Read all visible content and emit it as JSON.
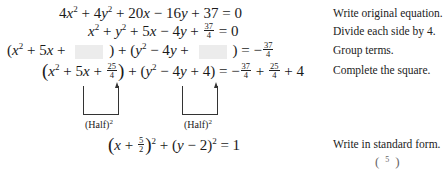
{
  "steps": [
    {
      "equation": "4x² + 4y² + 20x − 16y + 37 = 0",
      "note": "Write original equation."
    },
    {
      "equation": "x² + y² + 5x − 4y + 37/4 = 0",
      "note": "Divide each side by 4."
    },
    {
      "equation": "(x² + 5x + ▢) + (y² − 4y + ▢) = −37/4",
      "note": "Group terms."
    },
    {
      "equation": "(x² + 5x + 25/4) + (y² − 4y + 4) = −37/4 + 25/4 + 4",
      "note": "Complete the square."
    },
    {
      "equation": "(x + 5/2)² + (y − 2)² = 1",
      "note": "Write in standard form."
    }
  ],
  "annotations": {
    "half_squared_left": "(Half)",
    "half_squared_right": "(Half)",
    "exponent": "2"
  },
  "tokens": {
    "r1": {
      "a": "4",
      "x": "x",
      "b": " + 4",
      "y": "y",
      "c": " + 20",
      "d": " − 16",
      "e": " + 37 = 0"
    },
    "r2": {
      "plus1": " + ",
      "plus2": " + 5",
      "minus": " − 4",
      "plus3": " + ",
      "n": "37",
      "dn": "4",
      "eq": " = 0"
    },
    "r3": {
      "open": "(",
      "p1": " + 5",
      "p2": " + ",
      "close": ") + (",
      "m": " − 4",
      "p3": " + ",
      "close2": ") = −",
      "n": "37",
      "dn": "4"
    },
    "r4": {
      "p1": " + 5",
      "p2": " + ",
      "n1": "25",
      "d1": "4",
      "mid": ") + (",
      "m": " − 4",
      "p3": " + 4",
      "eqm": ") = −",
      "n2": "37",
      "d2": "4",
      "pl": " + ",
      "n3": "25",
      "d3": "4",
      "p4": " + 4"
    },
    "r5": {
      "p1": " + ",
      "n": "5",
      "d": "2",
      "mid": " + (",
      "m": " − 2)",
      "eq": " = 1"
    },
    "sq": "2"
  }
}
